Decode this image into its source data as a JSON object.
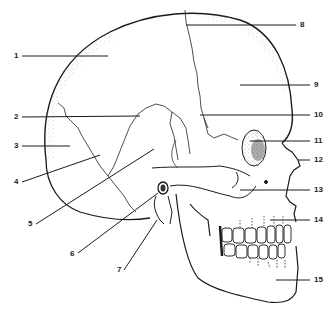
{
  "diagram": {
    "line_color": "#1a1a1a",
    "background": "#ffffff",
    "labels_left": [
      {
        "num": "1",
        "x": 14,
        "y": 52
      },
      {
        "num": "2",
        "x": 14,
        "y": 113
      },
      {
        "num": "3",
        "x": 14,
        "y": 142
      },
      {
        "num": "4",
        "x": 14,
        "y": 178
      },
      {
        "num": "5",
        "x": 28,
        "y": 220
      },
      {
        "num": "6",
        "x": 70,
        "y": 250
      },
      {
        "num": "7",
        "x": 117,
        "y": 266
      }
    ],
    "labels_right": [
      {
        "num": "8",
        "x": 302,
        "y": 21
      },
      {
        "num": "9",
        "x": 314,
        "y": 81
      },
      {
        "num": "10",
        "x": 314,
        "y": 111
      },
      {
        "num": "11",
        "x": 314,
        "y": 137
      },
      {
        "num": "12",
        "x": 314,
        "y": 156
      },
      {
        "num": "13",
        "x": 314,
        "y": 186
      },
      {
        "num": "14",
        "x": 314,
        "y": 216
      },
      {
        "num": "15",
        "x": 314,
        "y": 276
      }
    ]
  }
}
